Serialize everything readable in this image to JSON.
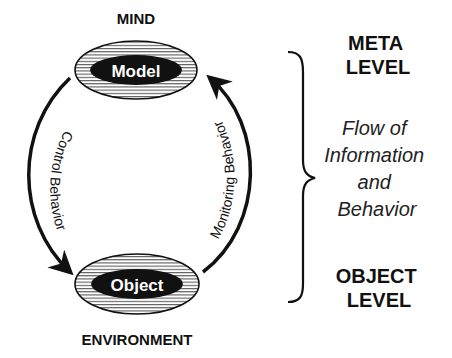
{
  "diagram": {
    "nodes": {
      "top": {
        "caption": "MIND",
        "label": "Model"
      },
      "bottom": {
        "caption": "ENVIRONMENT",
        "label": "Object"
      }
    },
    "edges": {
      "left": {
        "label": "Control  Behavior",
        "direction": "Model to Object"
      },
      "right": {
        "label": "Monitoring  Behavior",
        "direction": "Object to Model"
      }
    },
    "levels": {
      "meta": {
        "line1": "META",
        "line2": "LEVEL"
      },
      "flow": {
        "line1": "Flow of",
        "line2": "Information",
        "line3": "and",
        "line4": "Behavior"
      },
      "object": {
        "line1": "OBJECT",
        "line2": "LEVEL"
      }
    },
    "colors": {
      "ink": "#111111",
      "background": "#ffffff"
    }
  }
}
